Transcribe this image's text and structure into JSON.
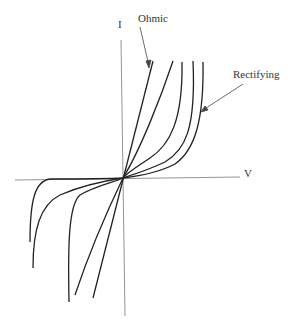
{
  "diagram": {
    "axes": {
      "x_label": "V",
      "y_label": "I"
    },
    "annotations": [
      {
        "id": "ohmic",
        "text": "Ohmic",
        "points_to": "linear curve"
      },
      {
        "id": "rectifying",
        "text": "Rectifying",
        "points_to": "most nonlinear curve"
      }
    ],
    "curves": [
      {
        "name": "ohmic",
        "type": "linear"
      },
      {
        "name": "curve-2",
        "type": "slightly nonlinear"
      },
      {
        "name": "curve-3",
        "type": "nonlinear"
      },
      {
        "name": "curve-4",
        "type": "more nonlinear"
      },
      {
        "name": "rectifying",
        "type": "strongly nonlinear"
      }
    ],
    "colors": {
      "axis": "#777777",
      "curve": "#222222",
      "text": "#333333"
    }
  }
}
